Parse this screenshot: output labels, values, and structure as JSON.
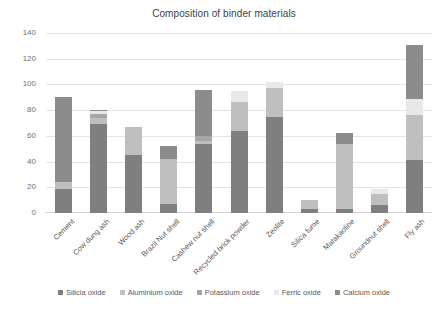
{
  "chart_data": {
    "type": "bar",
    "stacked": true,
    "title": "Composition of binder materials",
    "xlabel": "",
    "ylabel": "",
    "ylim": [
      0,
      140
    ],
    "yticks": [
      0,
      20,
      40,
      60,
      80,
      100,
      120,
      140
    ],
    "grid": true,
    "legend_position": "bottom",
    "categories": [
      "Cement",
      "Cow dung ash",
      "Wood ash",
      "Brazil Nut shell",
      "Cashew nut shell",
      "Recycled brick powder",
      "Zeolite",
      "Silica fume",
      "Matakaoline",
      "Groundnut shell",
      "Fly ash"
    ],
    "series": [
      {
        "name": "Silicia oxide",
        "color": "#7f7f7f",
        "values": [
          19,
          69,
          45,
          7,
          54,
          64,
          75,
          3,
          3,
          6,
          41
        ]
      },
      {
        "name": "Aluminium oxide",
        "color": "#bfbfbf",
        "values": [
          5,
          5,
          22,
          35,
          2,
          22,
          22,
          7,
          51,
          9,
          35
        ]
      },
      {
        "name": "Potassium oxide",
        "color": "#a6a6a6",
        "values": [
          0,
          3,
          0,
          0,
          4,
          0,
          0,
          0,
          0,
          0,
          0
        ]
      },
      {
        "name": "Ferric oxide",
        "color": "#e8e8e8",
        "values": [
          0,
          2,
          0,
          0,
          0,
          9,
          5,
          0,
          0,
          4,
          13
        ]
      },
      {
        "name": "Calcium oxide",
        "color": "#8c8c8c",
        "values": [
          66,
          1,
          0,
          10,
          36,
          0,
          0,
          0,
          8,
          0,
          42
        ]
      }
    ],
    "totals": [
      90,
      80,
      67,
      52,
      96,
      95,
      102,
      10,
      62,
      19,
      131
    ]
  }
}
